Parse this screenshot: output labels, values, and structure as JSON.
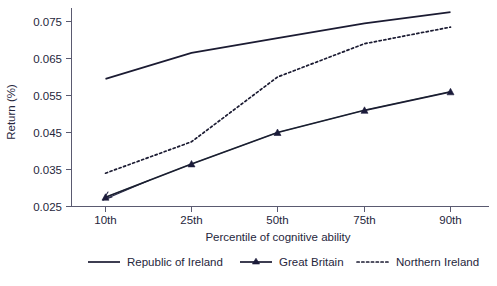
{
  "chart_data": {
    "type": "line",
    "title": "",
    "xlabel": "Percentile of cognitive ability",
    "ylabel": "Return (%)",
    "categories": [
      "10th",
      "25th",
      "50th",
      "75th",
      "90th"
    ],
    "ylim": [
      0.025,
      0.0775
    ],
    "yticks": [
      "0.025",
      "0.035",
      "0.045",
      "0.055",
      "0.065",
      "0.075"
    ],
    "ytick_values": [
      0.025,
      0.035,
      0.045,
      0.055,
      0.065,
      0.075
    ],
    "grid": false,
    "legend_position": "bottom",
    "series": [
      {
        "name": "Republic of Ireland",
        "style": "solid",
        "marker": "none",
        "color": "#1b1b32",
        "values": [
          0.0595,
          0.0665,
          0.0705,
          0.0745,
          0.0775
        ]
      },
      {
        "name": "Great Britain",
        "style": "solid",
        "marker": "triangle",
        "color": "#1b1b32",
        "values": [
          0.0275,
          0.0365,
          0.045,
          0.051,
          0.056
        ]
      },
      {
        "name": "Northern Ireland",
        "style": "dotted",
        "marker": "none",
        "color": "#1b1b32",
        "values": [
          0.034,
          0.0425,
          0.06,
          0.069,
          0.0735
        ]
      }
    ]
  },
  "axes": {
    "ylabel": "Return (%)",
    "xlabel": "Percentile of cognitive ability",
    "ytick_0": "0.075",
    "ytick_1": "0.065",
    "ytick_2": "0.055",
    "ytick_3": "0.045",
    "ytick_4": "0.035",
    "ytick_5": "0.025",
    "xtick_0": "10th",
    "xtick_1": "25th",
    "xtick_2": "50th",
    "xtick_3": "75th",
    "xtick_4": "90th"
  },
  "legend": {
    "item_0": "Republic of Ireland",
    "item_1": "Great Britain",
    "item_2": "Northern Ireland"
  }
}
